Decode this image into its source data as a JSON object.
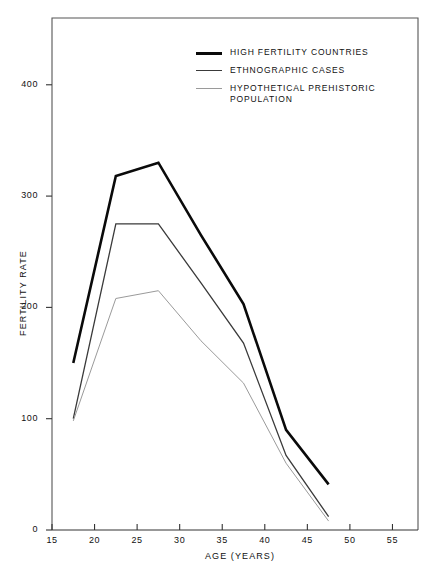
{
  "chart_data": {
    "type": "line",
    "title": "",
    "xlabel": "AGE (YEARS)",
    "ylabel": "FERTILITY RATE",
    "xlim": [
      15,
      58
    ],
    "ylim": [
      0,
      460
    ],
    "xticks": [
      15,
      20,
      25,
      30,
      35,
      40,
      45,
      50,
      55
    ],
    "yticks": [
      0,
      100,
      200,
      300,
      400
    ],
    "grid": false,
    "legend_position": "top-center",
    "series": [
      {
        "name": "HIGH FERTILITY COUNTRIES",
        "color": "#0a0a0a",
        "width": 2.6,
        "x": [
          17.5,
          22.5,
          27.5,
          32.5,
          37.5,
          42.5,
          47.5
        ],
        "values": [
          150,
          318,
          330,
          265,
          203,
          90,
          41
        ]
      },
      {
        "name": "ETHNOGRAPHIC CASES",
        "color": "#3a3a3a",
        "width": 1.3,
        "x": [
          17.5,
          22.5,
          27.5,
          32.5,
          37.5,
          42.5,
          47.5
        ],
        "values": [
          100,
          275,
          275,
          222,
          168,
          67,
          12
        ]
      },
      {
        "name": "HYPOTHETICAL PREHISTORIC\nPOPULATION",
        "color": "#9a9a9a",
        "width": 1.0,
        "x": [
          17.5,
          22.5,
          27.5,
          32.5,
          37.5,
          42.5,
          47.5
        ],
        "values": [
          98,
          208,
          215,
          170,
          132,
          60,
          8
        ]
      }
    ]
  },
  "axes": {
    "y_label": "FERTILITY RATE",
    "x_label": "AGE (YEARS)",
    "y_ticks": [
      "0",
      "100",
      "200",
      "300",
      "400"
    ],
    "x_ticks": [
      "15",
      "20",
      "25",
      "30",
      "35",
      "40",
      "45",
      "50",
      "55"
    ]
  },
  "legend": {
    "items": [
      {
        "label": "HIGH FERTILITY COUNTRIES",
        "style": "sw-thick"
      },
      {
        "label": "ETHNOGRAPHIC CASES",
        "style": "sw-med"
      },
      {
        "label": "HYPOTHETICAL PREHISTORIC\nPOPULATION",
        "style": "sw-thin"
      }
    ]
  },
  "frame": {
    "color": "#555555"
  }
}
